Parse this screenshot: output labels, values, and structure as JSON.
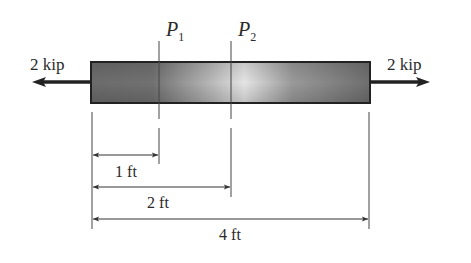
{
  "diagram": {
    "type": "axially loaded bar",
    "loads": {
      "left": {
        "label": "2 kip",
        "direction": "left"
      },
      "right": {
        "label": "2 kip",
        "direction": "right"
      }
    },
    "sections": [
      {
        "name": "P",
        "sub": "1",
        "position_ft": 1
      },
      {
        "name": "P",
        "sub": "2",
        "position_ft": 2
      }
    ],
    "dimensions": [
      {
        "label": "1 ft",
        "from": 0,
        "to": 1
      },
      {
        "label": "2 ft",
        "from": 0,
        "to": 2
      },
      {
        "label": "4 ft",
        "from": 0,
        "to": 4
      }
    ],
    "colors": {
      "bar_dark": "#6a6a6a",
      "bar_light": "#e6e6e6",
      "outline": "#222222",
      "line": "#333333"
    }
  }
}
